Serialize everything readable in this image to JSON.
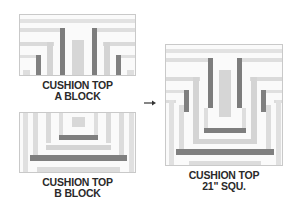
{
  "colors": {
    "light": "#dcdcdc",
    "mid": "#c4c4c4",
    "dark": "#7f7f7f",
    "bg": "#fafafa"
  },
  "block_a": {
    "label_line1": "CUSHION TOP",
    "label_line2": "A BLOCK"
  },
  "block_b": {
    "label_line1": "CUSHION TOP",
    "label_line2": "B BLOCK"
  },
  "combined": {
    "label_line1": "CUSHION TOP",
    "label_line2": "21\" SQU."
  },
  "arrow": {
    "icon": "arrow-right-icon"
  }
}
